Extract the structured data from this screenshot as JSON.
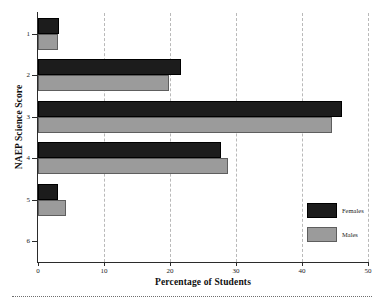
{
  "chart_data": {
    "type": "bar",
    "orientation": "horizontal",
    "title": "",
    "xlabel": "Percentage of Students",
    "ylabel": "NAEP Science Score",
    "categories": [
      "1",
      "2",
      "3",
      "4",
      "5",
      "6"
    ],
    "xlim": [
      0,
      50
    ],
    "ylim_categories": 6,
    "xticks": [
      "0",
      "10",
      "20",
      "30",
      "40",
      "50"
    ],
    "xtick_values": [
      0,
      10,
      20,
      30,
      40,
      50
    ],
    "grid": "vertical-dashed",
    "legend_position": "bottom-right",
    "series": [
      {
        "name": "Females",
        "color": "#1c1c1c",
        "values": [
          3.2,
          21.7,
          46.0,
          27.7,
          3.0,
          0.0
        ]
      },
      {
        "name": "Males",
        "color": "#9b9b9b",
        "values": [
          3.1,
          19.8,
          44.5,
          28.8,
          4.2,
          0.0
        ]
      }
    ]
  },
  "legend": {
    "entries": [
      {
        "label": "Females"
      },
      {
        "label": "Males"
      }
    ]
  },
  "axes": {
    "x_title": "Percentage of Students",
    "y_title": "NAEP Science Score"
  },
  "colors": {
    "females": "#1c1c1c",
    "males": "#9b9b9b",
    "axis": "#2b2b2b",
    "grid": "#b9b9b9",
    "background": "#ffffff"
  }
}
